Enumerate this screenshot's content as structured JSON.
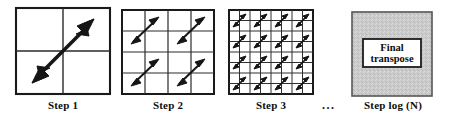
{
  "figure": {
    "background_color": "#ffffff",
    "line_color": "#1a1a1a",
    "arrow_color": "#161616",
    "panel_fill": "#ffffff",
    "shaded_fill": "#c9c9c9"
  },
  "panels": [
    {
      "id": "step1",
      "caption": "Step 1",
      "grid_divisions": 2,
      "arrow_count": 1,
      "arrow_style": "large-double-headed-diagonal",
      "shaded": false
    },
    {
      "id": "step2",
      "caption": "Step 2",
      "grid_divisions": 4,
      "arrow_count": 4,
      "arrow_style": "medium-double-headed-diagonal",
      "shaded": false
    },
    {
      "id": "step3",
      "caption": "Step 3",
      "grid_divisions": 8,
      "arrow_count": 16,
      "arrow_style": "small-double-headed-diagonal",
      "shaded": false
    },
    {
      "id": "step4",
      "caption": "Step  log (N)",
      "grid_divisions": 0,
      "arrow_count": 0,
      "arrow_style": "none",
      "shaded": true,
      "inner_box_line_1": "Final",
      "inner_box_line_2": "transpose"
    }
  ],
  "ellipsis": {
    "text": "...",
    "meaning": "continuation between Step 3 and final step"
  }
}
